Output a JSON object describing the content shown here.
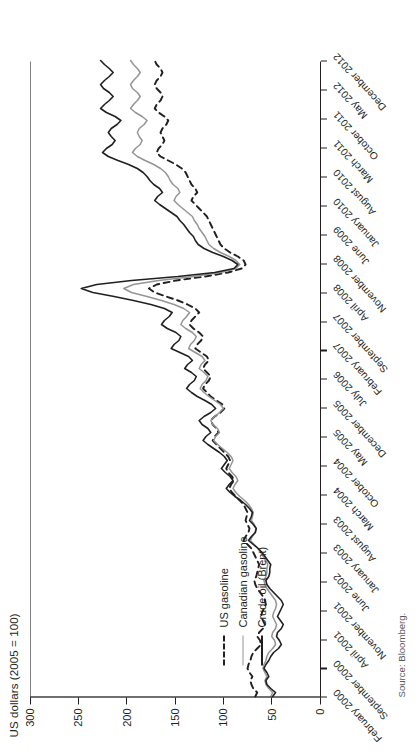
{
  "figure": {
    "source_note": "Source: Bloomberg.",
    "orientation": "rotated-90-ccw"
  },
  "chart_data": {
    "type": "line",
    "title": "",
    "ylabel": "US dollars (2005 = 100)",
    "xlabel": "",
    "ylim": [
      0,
      300
    ],
    "yticks": [
      0,
      50,
      100,
      150,
      200,
      250,
      300
    ],
    "ytick_labels": [
      "0",
      "50",
      "100",
      "150",
      "200",
      "250",
      "300"
    ],
    "grid": false,
    "legend_position": "inside-lower-left",
    "xtick_labels": [
      "February 2000",
      "September 2000",
      "April 2001",
      "November 2001",
      "June 2002",
      "January 2003",
      "August 2003",
      "March 2004",
      "October 2004",
      "May 2005",
      "December 2005",
      "July 2006",
      "February 2007",
      "September 2007",
      "April 2008",
      "November 2008",
      "June 2009",
      "January 2010",
      "August 2010",
      "March 2011",
      "October 2011",
      "May 2012",
      "December 2012"
    ],
    "x_start": "February 2000",
    "x_end": "December 2012",
    "x_step_months": 7,
    "series": [
      {
        "name": "US gasoline",
        "style": "dashed",
        "color": "#231f20",
        "values": [
          68,
          66,
          70,
          72,
          73,
          71,
          74,
          76,
          75,
          73,
          72,
          70,
          66,
          62,
          63,
          66,
          64,
          60,
          58,
          60,
          62,
          61,
          59,
          57,
          58,
          60,
          63,
          66,
          68,
          69,
          67,
          66,
          65,
          64,
          66,
          68,
          70,
          72,
          76,
          80,
          78,
          75,
          74,
          76,
          78,
          77,
          76,
          78,
          80,
          84,
          88,
          92,
          95,
          93,
          90,
          92,
          96,
          98,
          96,
          94,
          96,
          100,
          104,
          108,
          112,
          110,
          106,
          108,
          112,
          114,
          110,
          104,
          100,
          102,
          108,
          114,
          118,
          122,
          120,
          116,
          114,
          118,
          122,
          120,
          116,
          118,
          124,
          130,
          128,
          124,
          122,
          126,
          132,
          136,
          134,
          130,
          126,
          130,
          138,
          148,
          160,
          172,
          178,
          170,
          150,
          120,
          96,
          82,
          78,
          80,
          86,
          94,
          100,
          104,
          106,
          108,
          110,
          112,
          114,
          116,
          118,
          122,
          126,
          130,
          134,
          132,
          128,
          130,
          134,
          136,
          138,
          140,
          144,
          150,
          158,
          166,
          170,
          168,
          164,
          162,
          164,
          166,
          164,
          160,
          158,
          162,
          168,
          172,
          170,
          166,
          164,
          166,
          170,
          172,
          170,
          166,
          164,
          166,
          170,
          172
        ]
      },
      {
        "name": "Canadian gasoline",
        "style": "solid",
        "color": "#939598",
        "values": [
          52,
          50,
          54,
          57,
          58,
          56,
          58,
          60,
          59,
          57,
          56,
          54,
          50,
          47,
          48,
          51,
          50,
          47,
          46,
          48,
          50,
          49,
          47,
          46,
          47,
          50,
          53,
          56,
          58,
          59,
          57,
          56,
          56,
          55,
          57,
          60,
          62,
          65,
          69,
          73,
          71,
          68,
          67,
          69,
          72,
          71,
          70,
          72,
          75,
          79,
          84,
          88,
          91,
          89,
          86,
          88,
          92,
          95,
          93,
          91,
          93,
          97,
          102,
          107,
          111,
          109,
          105,
          107,
          112,
          114,
          110,
          105,
          101,
          104,
          110,
          116,
          121,
          125,
          123,
          119,
          117,
          121,
          126,
          124,
          120,
          123,
          130,
          137,
          135,
          131,
          129,
          133,
          140,
          145,
          143,
          139,
          136,
          142,
          152,
          165,
          180,
          196,
          204,
          194,
          168,
          132,
          104,
          88,
          84,
          88,
          95,
          104,
          111,
          116,
          118,
          120,
          123,
          126,
          128,
          131,
          133,
          138,
          143,
          148,
          152,
          150,
          146,
          148,
          153,
          156,
          158,
          161,
          166,
          173,
          182,
          190,
          195,
          192,
          187,
          185,
          188,
          190,
          188,
          183,
          180,
          185,
          192,
          197,
          194,
          190,
          187,
          190,
          195,
          197,
          194,
          190,
          187,
          190,
          194,
          197
        ]
      },
      {
        "name": "Crude oil (Brent)",
        "style": "solid",
        "color": "#231f20",
        "values": [
          50,
          47,
          52,
          56,
          57,
          54,
          56,
          59,
          57,
          54,
          52,
          49,
          44,
          41,
          43,
          46,
          45,
          41,
          39,
          42,
          45,
          43,
          41,
          39,
          41,
          45,
          49,
          53,
          56,
          57,
          54,
          53,
          53,
          52,
          55,
          58,
          61,
          65,
          70,
          75,
          72,
          68,
          67,
          70,
          74,
          72,
          71,
          74,
          78,
          83,
          89,
          94,
          98,
          95,
          91,
          94,
          99,
          103,
          100,
          97,
          100,
          105,
          111,
          117,
          122,
          119,
          114,
          117,
          123,
          126,
          121,
          114,
          109,
          113,
          120,
          128,
          134,
          139,
          136,
          131,
          129,
          134,
          141,
          138,
          133,
          137,
          146,
          155,
          152,
          147,
          145,
          150,
          159,
          165,
          162,
          157,
          154,
          162,
          176,
          194,
          214,
          236,
          248,
          232,
          196,
          148,
          110,
          90,
          86,
          92,
          101,
          112,
          121,
          127,
          130,
          132,
          136,
          139,
          142,
          146,
          149,
          155,
          161,
          167,
          172,
          169,
          164,
          167,
          173,
          177,
          180,
          184,
          190,
          199,
          210,
          220,
          226,
          222,
          216,
          213,
          217,
          220,
          217,
          211,
          207,
          213,
          222,
          228,
          224,
          219,
          215,
          219,
          225,
          228,
          224,
          219,
          215,
          219,
          224,
          228
        ]
      }
    ]
  }
}
